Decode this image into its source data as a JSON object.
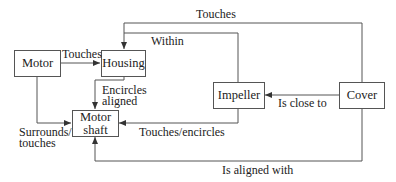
{
  "nodes": {
    "motor": "Motor",
    "housing": "Housing",
    "motor_shaft_line1": "Motor",
    "motor_shaft_line2": "shaft",
    "impeller": "Impeller",
    "cover": "Cover"
  },
  "edges": [
    {
      "from": "Motor",
      "to": "Housing",
      "label": "Touches"
    },
    {
      "from": "Cover",
      "to": "Housing",
      "label": "Touches"
    },
    {
      "from": "Impeller",
      "to": "Housing",
      "label": "Within"
    },
    {
      "from": "Housing",
      "to": "Motor shaft",
      "label_line1": "Encircles",
      "label_line2": "aligned"
    },
    {
      "from": "Motor",
      "to": "Motor shaft",
      "label_line1": "Surrounds/",
      "label_line2": "touches"
    },
    {
      "from": "Impeller",
      "to": "Motor shaft",
      "label": "Touches/encircles"
    },
    {
      "from": "Cover",
      "to": "Impeller",
      "label": "Is close to"
    },
    {
      "from": "Cover",
      "to": "Motor shaft",
      "label": "Is aligned with"
    }
  ],
  "colors": {
    "line": "#555555",
    "text": "#222222",
    "background": "#ffffff"
  }
}
